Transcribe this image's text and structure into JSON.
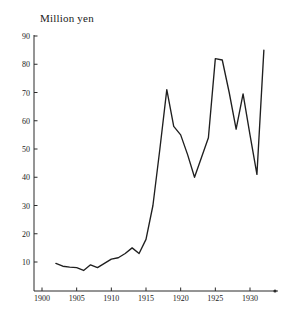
{
  "chart_data": {
    "type": "line",
    "title": "",
    "ylabel": "Million yen",
    "xlabel": "",
    "ylim": [
      0,
      90
    ],
    "xlim": [
      1900,
      1933
    ],
    "grid": false,
    "legend": "none",
    "y_ticks": [
      10,
      20,
      30,
      40,
      50,
      60,
      70,
      80,
      90
    ],
    "x_ticks": [
      1900,
      1905,
      1910,
      1915,
      1920,
      1925,
      1930
    ],
    "x": [
      1902,
      1903,
      1904,
      1905,
      1906,
      1907,
      1908,
      1909,
      1910,
      1911,
      1912,
      1913,
      1914,
      1915,
      1916,
      1917,
      1918,
      1919,
      1920,
      1921,
      1922,
      1923,
      1924,
      1925,
      1926,
      1927,
      1928,
      1929,
      1930,
      1931,
      1932
    ],
    "values": [
      9.5,
      8.5,
      8.2,
      8.0,
      7.0,
      9.0,
      8.0,
      9.5,
      11.0,
      11.5,
      13.0,
      15.0,
      13.0,
      18.0,
      30.0,
      50.0,
      71.0,
      58.0,
      55.0,
      48.0,
      40.0,
      47.0,
      54.0,
      82.0,
      81.5,
      70.0,
      57.0,
      69.5,
      55.0,
      41.0,
      85.0
    ],
    "series_name": "Million yen"
  },
  "axis": {
    "title_text": "Million yen",
    "y_tick_labels": [
      "90",
      "80",
      "70",
      "60",
      "50",
      "40",
      "30",
      "20",
      "10"
    ],
    "x_tick_labels": [
      "1900",
      "1905",
      "1910",
      "1915",
      "1920",
      "1925",
      "1930"
    ]
  },
  "style": {
    "line_color": "#1f1f1f",
    "axis_color": "#2b2b2b",
    "background": "#ffffff"
  }
}
